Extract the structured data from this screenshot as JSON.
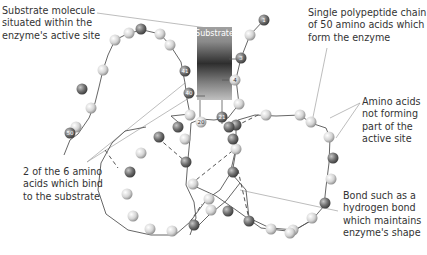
{
  "labels": {
    "substrate_molecule": [
      "Substrate molecule",
      "situated within the",
      "enzyme's active site"
    ],
    "polypeptide_chain": [
      "Single polypeptide chain",
      "of 50 amino acids which",
      "form the enzyme"
    ],
    "not_active_site": [
      "Amino acids",
      "not forming",
      "part of the",
      "active site"
    ],
    "bind_substrate": [
      "2 of the 6 amino",
      "acids  which bind",
      "to the substrate"
    ],
    "bond": [
      "Bond such as a",
      "hydrogen bond",
      "which maintains",
      "enzyme's shape"
    ]
  },
  "substrate": {
    "label": "Substrate"
  },
  "numbered_amino_acids": {
    "n1": "1",
    "n3": "3",
    "n4": "4",
    "n20": "20",
    "n21": "21",
    "n40": "40",
    "n41": "41",
    "n50": "50"
  },
  "colors": {
    "light_amino_acid": "#d8d8d8",
    "dark_amino_acid": "#7a7a7a",
    "chain_line": "#555555",
    "leader_line": "#999999",
    "substrate_top": "#9a9a9a",
    "substrate_mid": "#333333",
    "substrate_bottom": "#b5b5b5"
  }
}
